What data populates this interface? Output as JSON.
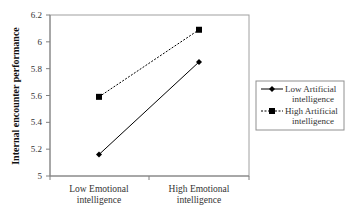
{
  "chart_data": {
    "type": "line",
    "title": "",
    "xlabel": "",
    "ylabel": "Internal encounter performance",
    "categories": [
      "Low Emotional intelligence",
      "High Emotional intelligence"
    ],
    "category_lines": [
      [
        "Low Emotional",
        "intelligence"
      ],
      [
        "High Emotional",
        "intelligence"
      ]
    ],
    "ylim": [
      5,
      6.2
    ],
    "yticks": [
      5,
      5.2,
      5.4,
      5.6,
      5.8,
      6,
      6.2
    ],
    "ytick_labels": [
      "5",
      "5.2",
      "5.4",
      "5.6",
      "5.8",
      "6",
      "6.2"
    ],
    "grid": false,
    "legend_position": "right",
    "series": [
      {
        "name": "Low Artificial intelligence",
        "name_lines": [
          "Low Artificial",
          "intelligence"
        ],
        "values": [
          5.16,
          5.85
        ],
        "marker": "diamond",
        "line_style": "solid",
        "color": "#000000"
      },
      {
        "name": "High Artificial intelligence",
        "name_lines": [
          "High Artificial",
          "intelligence"
        ],
        "values": [
          5.59,
          6.09
        ],
        "marker": "square",
        "line_style": "dashed",
        "color": "#000000"
      }
    ]
  }
}
